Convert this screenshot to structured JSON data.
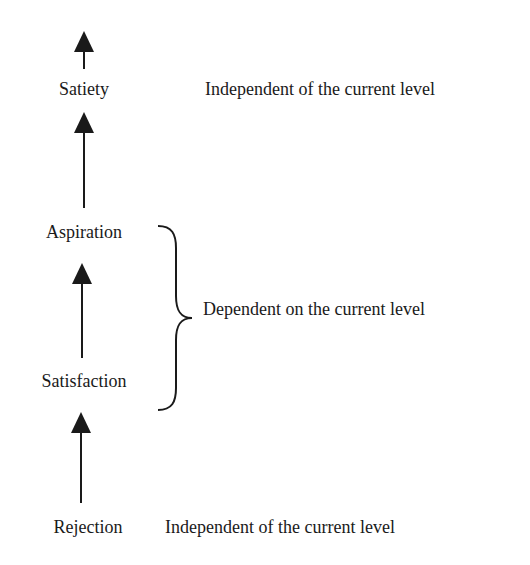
{
  "diagram": {
    "levels": [
      {
        "id": "satiety",
        "label": "Satiety"
      },
      {
        "id": "aspiration",
        "label": "Aspiration"
      },
      {
        "id": "satisfaction",
        "label": "Satisfaction"
      },
      {
        "id": "rejection",
        "label": "Rejection"
      }
    ],
    "annotations": {
      "top": "Independent of the current level",
      "middle": "Dependent on the current level",
      "bottom": "Independent of the current level"
    },
    "colors": {
      "ink": "#1a1a1a",
      "background": "#ffffff"
    }
  }
}
